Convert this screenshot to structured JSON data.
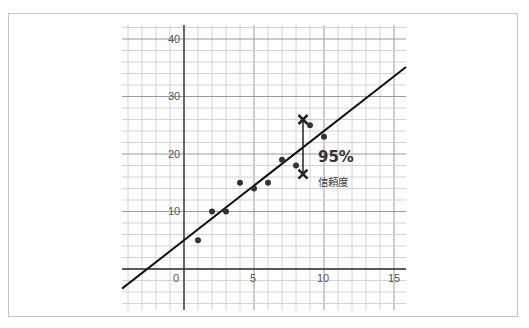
{
  "chart_data": {
    "type": "scatter",
    "title": "",
    "xlabel": "",
    "ylabel": "",
    "xlim": [
      -4.3,
      15.9
    ],
    "ylim": [
      -7.1,
      42.5
    ],
    "grid": true,
    "x_ticks": [
      0,
      5,
      10,
      15
    ],
    "y_ticks": [
      10,
      20,
      30,
      40
    ],
    "x_tick_labels": [
      "0",
      "5",
      "10",
      "15"
    ],
    "y_tick_labels": [
      "10",
      "20",
      "30",
      "40"
    ],
    "series": [
      {
        "name": "data points",
        "x": [
          1,
          2,
          3,
          4,
          5,
          6,
          7,
          8,
          9,
          10
        ],
        "y": [
          5,
          10,
          10,
          15,
          14,
          15,
          19,
          18,
          25,
          23
        ]
      }
    ],
    "regression_line": {
      "slope": 1.9,
      "intercept": 5
    },
    "confidence_interval": {
      "x": 8.5,
      "upper": 26,
      "lower": 16.5
    },
    "annotations": [
      {
        "text": "95%",
        "x": 9.5,
        "y": 19.5
      },
      {
        "text": "信頼度",
        "x": 9.5,
        "y": 15.5
      }
    ]
  },
  "labels": {
    "percent": "95%",
    "confidence": "信頼度",
    "x0": "0",
    "x5": "5",
    "x10": "10",
    "x15": "15",
    "y10": "10",
    "y20": "20",
    "y30": "30",
    "y40": "40"
  }
}
